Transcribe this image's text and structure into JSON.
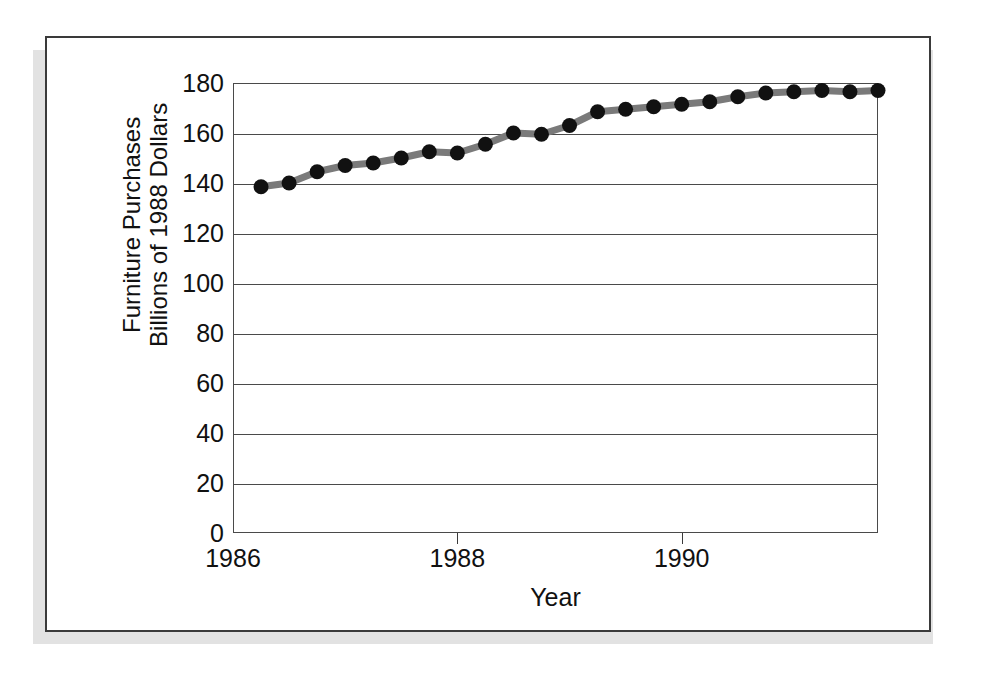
{
  "figure": {
    "frame_border_color": "#3a3a3a",
    "shadow_color": "#e2e2e2",
    "background": "#ffffff"
  },
  "chart_data": {
    "type": "line",
    "title": "",
    "subtitle": "",
    "xlabel": "Year",
    "ylabel": "Furniture Purchases Billions of 1988 Dollars",
    "ylabel_line1": "Furniture Purchases",
    "ylabel_line2": "Billions of 1988 Dollars",
    "grid": true,
    "grid_axis": "y",
    "legend": false,
    "legend_position": "none",
    "xlim": [
      1986.0,
      1991.75
    ],
    "ylim": [
      0,
      180
    ],
    "yticks": [
      0,
      20,
      40,
      60,
      80,
      100,
      120,
      140,
      160,
      180
    ],
    "ytick_labels": [
      "0",
      "20",
      "40",
      "60",
      "80",
      "100",
      "120",
      "140",
      "160",
      "180"
    ],
    "xticks": [
      1986,
      1988,
      1990
    ],
    "xtick_labels": [
      "1986",
      "1988",
      "1990"
    ],
    "line_color": "#7a7a7a",
    "marker_color": "#111111",
    "marker": "circle",
    "x": [
      1986.25,
      1986.5,
      1986.75,
      1987.0,
      1987.25,
      1987.5,
      1987.75,
      1988.0,
      1988.25,
      1988.5,
      1988.75,
      1989.0,
      1989.25,
      1989.5,
      1989.75,
      1990.0,
      1990.25,
      1990.5,
      1990.75,
      1991.0,
      1991.25,
      1991.5,
      1991.75
    ],
    "values": [
      138.5,
      140.0,
      144.5,
      147.0,
      148.0,
      150.0,
      152.5,
      152.0,
      155.5,
      160.0,
      159.5,
      163.0,
      168.5,
      169.5,
      170.5,
      171.5,
      172.5,
      174.5,
      176.0,
      176.5,
      177.0,
      176.5,
      177.0
    ],
    "series": [
      {
        "name": "Furniture Purchases",
        "values": [
          138.5,
          140.0,
          144.5,
          147.0,
          148.0,
          150.0,
          152.5,
          152.0,
          155.5,
          160.0,
          159.5,
          163.0,
          168.5,
          169.5,
          170.5,
          171.5,
          172.5,
          174.5,
          176.0,
          176.5,
          177.0,
          176.5,
          177.0
        ]
      }
    ]
  }
}
